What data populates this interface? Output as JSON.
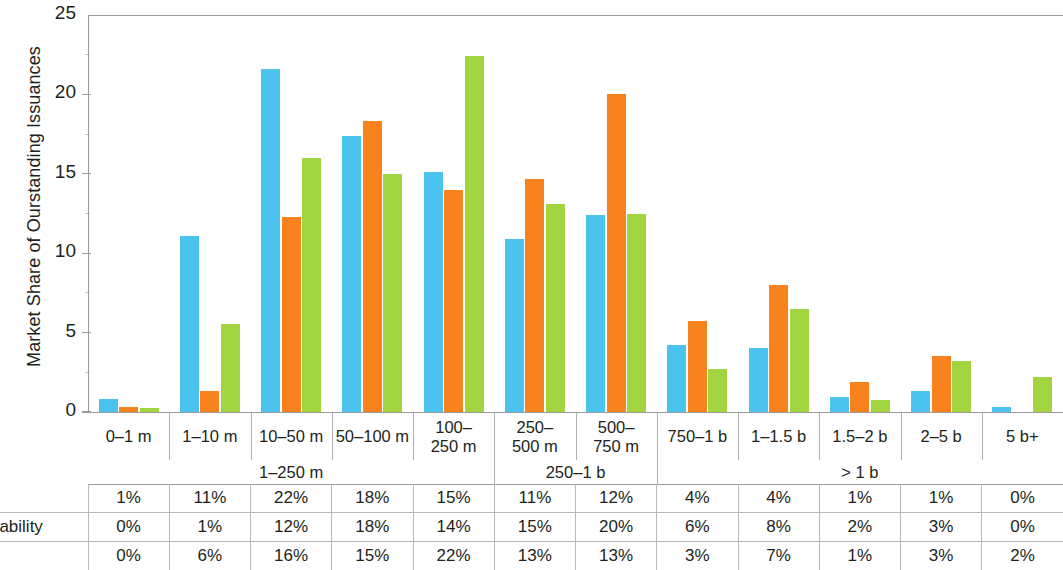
{
  "chart_data": {
    "type": "bar",
    "title": "",
    "subtitle": "",
    "xlabel": "",
    "ylabel": "Market Share of Ourstanding Issuances",
    "ylim": [
      0,
      25
    ],
    "yticks": [
      "0",
      "5",
      "10",
      "15",
      "20",
      "25"
    ],
    "grid": false,
    "legend_position": "none",
    "categories": [
      "0–1 m",
      "1–10 m",
      "10–50 m",
      "50–100 m",
      "100–\n250 m",
      "250–\n500 m",
      "500–\n750 m",
      "750–1 b",
      "1–1.5 b",
      "1.5–2 b",
      "2–5 b",
      "5 b+"
    ],
    "category_groups": [
      {
        "label": "1–250 m",
        "start": 0,
        "end": 4
      },
      {
        "label": "250–1 b",
        "start": 5,
        "end": 6
      },
      {
        "label": "> 1 b",
        "start": 7,
        "end": 11
      }
    ],
    "series": [
      {
        "name": "Green",
        "color": "#4CC3EE",
        "values": [
          0.85,
          11.1,
          21.6,
          17.4,
          15.1,
          10.9,
          12.4,
          4.2,
          4.0,
          0.95,
          1.3,
          0.3
        ]
      },
      {
        "name": "Sustainability",
        "color": "#F7821E",
        "values": [
          0.3,
          1.35,
          12.3,
          18.3,
          14.0,
          14.7,
          20.0,
          5.7,
          8.0,
          1.9,
          3.5,
          0.0
        ]
      },
      {
        "name": "Social",
        "color": "#A2D440",
        "values": [
          0.25,
          5.55,
          16.0,
          15.0,
          22.4,
          13.1,
          12.5,
          2.7,
          6.5,
          0.75,
          3.2,
          2.2
        ]
      }
    ]
  },
  "data_table": {
    "row_labels": [
      "een",
      "tainability",
      "cial"
    ],
    "rows": [
      [
        "1%",
        "11%",
        "22%",
        "18%",
        "15%",
        "11%",
        "12%",
        "4%",
        "4%",
        "1%",
        "1%",
        "0%"
      ],
      [
        "0%",
        "1%",
        "12%",
        "18%",
        "14%",
        "15%",
        "20%",
        "6%",
        "8%",
        "2%",
        "3%",
        "0%"
      ],
      [
        "0%",
        "6%",
        "16%",
        "15%",
        "22%",
        "13%",
        "13%",
        "3%",
        "7%",
        "1%",
        "3%",
        "2%"
      ]
    ]
  }
}
